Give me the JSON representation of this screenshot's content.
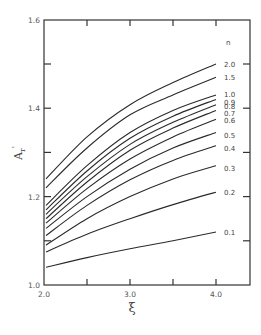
{
  "chart_data": {
    "type": "line",
    "title": "",
    "xlabel": "ξ",
    "ylabel": "A_r'",
    "xlim": [
      2.0,
      4.4
    ],
    "ylim": [
      1.0,
      1.6
    ],
    "grid": false,
    "x_ticks": [
      2.0,
      2.5,
      3.0,
      3.5,
      4.0
    ],
    "x_tick_labels": [
      "2.0",
      "",
      "3.0",
      "",
      "4.0"
    ],
    "y_ticks": [
      1.0,
      1.1,
      1.2,
      1.3,
      1.4,
      1.5,
      1.6
    ],
    "y_tick_labels": [
      "1.0",
      "",
      "1.2",
      "",
      "1.4",
      "",
      "1.6"
    ],
    "legend_title": "n",
    "x": [
      2.0,
      2.5,
      3.0,
      3.5,
      4.0
    ],
    "series": [
      {
        "name": "2.0",
        "values": [
          1.24,
          1.335,
          1.408,
          1.458,
          1.5
        ]
      },
      {
        "name": "1.5",
        "values": [
          1.22,
          1.31,
          1.385,
          1.43,
          1.47
        ]
      },
      {
        "name": "1.0",
        "values": [
          1.18,
          1.27,
          1.345,
          1.395,
          1.43
        ]
      },
      {
        "name": "0.9",
        "values": [
          1.17,
          1.258,
          1.332,
          1.382,
          1.42
        ]
      },
      {
        "name": "0.8",
        "values": [
          1.16,
          1.245,
          1.318,
          1.368,
          1.408
        ]
      },
      {
        "name": "0.7",
        "values": [
          1.15,
          1.233,
          1.305,
          1.355,
          1.395
        ]
      },
      {
        "name": "0.6",
        "values": [
          1.14,
          1.218,
          1.285,
          1.335,
          1.375
        ]
      },
      {
        "name": "0.5",
        "values": [
          1.128,
          1.2,
          1.262,
          1.31,
          1.345
        ]
      },
      {
        "name": "0.4",
        "values": [
          1.112,
          1.18,
          1.238,
          1.282,
          1.315
        ]
      },
      {
        "name": "0.3",
        "values": [
          1.09,
          1.15,
          1.2,
          1.24,
          1.27
        ]
      },
      {
        "name": "0.2",
        "values": [
          1.075,
          1.115,
          1.15,
          1.182,
          1.21
        ]
      },
      {
        "name": "0.1",
        "values": [
          1.04,
          1.062,
          1.082,
          1.1,
          1.12
        ]
      }
    ],
    "label_offsets": {
      "2.0": 0,
      "1.5": 0,
      "1.0": -1,
      "0.9": 3,
      "0.8": 1,
      "0.7": 3,
      "0.6": 1,
      "0.5": 2,
      "0.4": 2,
      "0.3": 2,
      "0.2": 0,
      "0.1": 0
    }
  }
}
